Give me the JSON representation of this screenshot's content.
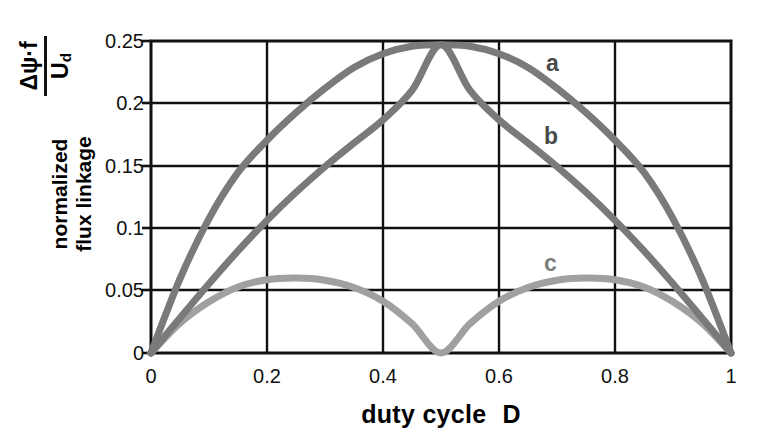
{
  "figure": {
    "y_axis": {
      "formula_numerator": "Δψ·f",
      "formula_denominator": "U",
      "formula_denominator_sub": "d",
      "label_line1": "normalized",
      "label_line2": "flux linkage",
      "ticks": [
        "0.25",
        "0.2",
        "0.15",
        "0.1",
        "0.05",
        "0"
      ]
    },
    "x_axis": {
      "label_text": "duty cycle",
      "label_symbol": "D",
      "ticks": [
        "0",
        "0.2",
        "0.4",
        "0.6",
        "0.8",
        "1"
      ]
    },
    "annotations": {
      "a": "a",
      "b": "b",
      "c": "c"
    },
    "colors": {
      "curve_a": "#7a7a7a",
      "curve_b": "#7a7a7a",
      "curve_c": "#a0a0a0",
      "axis": "#111111",
      "grid": "#111111",
      "background": "#ffffff"
    }
  },
  "chart_data": {
    "type": "line",
    "title": "",
    "xlabel": "duty cycle   D",
    "ylabel": "normalized flux linkage  (Δψ·f / U_d)",
    "xlim": [
      0,
      1
    ],
    "ylim": [
      0,
      0.25
    ],
    "xticks": [
      0,
      0.2,
      0.4,
      0.6,
      0.8,
      1
    ],
    "yticks": [
      0,
      0.05,
      0.1,
      0.15,
      0.2,
      0.25
    ],
    "grid": true,
    "legend": "inline annotations a, b, c",
    "x": [
      0,
      0.05,
      0.1,
      0.15,
      0.2,
      0.25,
      0.3,
      0.35,
      0.4,
      0.45,
      0.5,
      0.55,
      0.6,
      0.65,
      0.7,
      0.75,
      0.8,
      0.85,
      0.9,
      0.95,
      1
    ],
    "series": [
      {
        "name": "a",
        "label": "a",
        "values": [
          0,
          0.0595,
          0.1077,
          0.1447,
          0.1705,
          0.1926,
          0.2121,
          0.2288,
          0.2398,
          0.2458,
          0.247,
          0.2458,
          0.2398,
          0.2288,
          0.2121,
          0.1926,
          0.1705,
          0.1447,
          0.1077,
          0.0595,
          0
        ]
      },
      {
        "name": "b",
        "label": "b",
        "values": [
          0,
          0.0281,
          0.0555,
          0.0818,
          0.1063,
          0.1288,
          0.1494,
          0.1683,
          0.1868,
          0.2104,
          0.247,
          0.2104,
          0.1868,
          0.1683,
          0.1494,
          0.1288,
          0.1063,
          0.0818,
          0.0555,
          0.0281,
          0
        ]
      },
      {
        "name": "c",
        "label": "c",
        "values": [
          0,
          0.0239,
          0.041,
          0.0529,
          0.0587,
          0.06,
          0.0583,
          0.0525,
          0.0415,
          0.0235,
          0,
          0.0235,
          0.0415,
          0.0525,
          0.0583,
          0.06,
          0.0587,
          0.0529,
          0.041,
          0.0239,
          0
        ]
      }
    ],
    "annotation_points": [
      {
        "label": "a",
        "x": 0.66,
        "y": 0.233
      },
      {
        "label": "b",
        "x": 0.655,
        "y": 0.175
      },
      {
        "label": "c",
        "x": 0.655,
        "y": 0.073
      }
    ]
  }
}
